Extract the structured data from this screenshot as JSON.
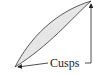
{
  "diagram": {
    "label": "Cusps",
    "colors": {
      "fill": "#e6e6e6",
      "stroke": "#333333",
      "text": "#222222"
    },
    "cusps": [
      {
        "name": "bottom-left-cusp",
        "x": 15,
        "y": 67
      },
      {
        "name": "top-right-cusp",
        "x": 91,
        "y": 1
      }
    ]
  }
}
